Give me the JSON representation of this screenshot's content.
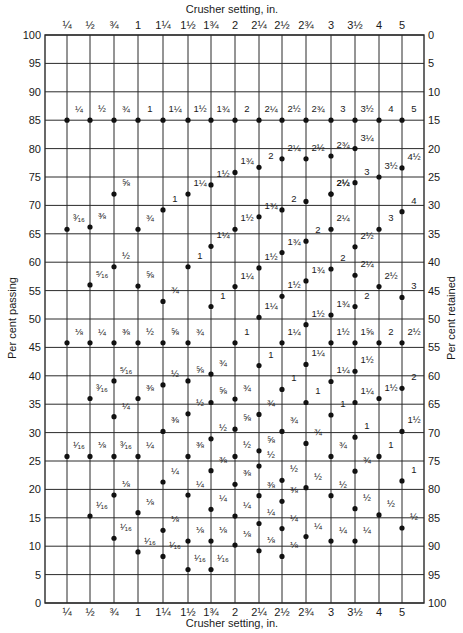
{
  "chart_data": {
    "type": "scatter",
    "title": "",
    "xlabel": "Crusher setting, in.",
    "ylabel": "Per cent passing",
    "ylabel_right": "Per cent retained",
    "ylim": [
      0,
      100
    ],
    "y_ticks_left": [
      100,
      95,
      90,
      85,
      80,
      75,
      70,
      65,
      60,
      55,
      50,
      45,
      40,
      35,
      30,
      25,
      20,
      15,
      10,
      5,
      0
    ],
    "y_ticks_right": [
      0,
      5,
      10,
      15,
      20,
      25,
      30,
      35,
      40,
      45,
      50,
      55,
      60,
      65,
      70,
      75,
      80,
      85,
      90,
      95,
      100
    ],
    "grid": true,
    "categories": [
      "1/4",
      "1/2",
      "3/4",
      "1",
      "1 1/4",
      "1 1/2",
      "1 3/4",
      "2",
      "2 1/4",
      "2 1/2",
      "2 3/4",
      "3",
      "3 1/2",
      "4",
      "5"
    ],
    "category_labels_top": [
      "¼",
      "½",
      "¾",
      "1",
      "1¼",
      "1½",
      "1¾",
      "2",
      "2¼",
      "2½",
      "2¾",
      "3",
      "3½",
      "4",
      "5"
    ],
    "category_labels_bottom": [
      "¼",
      "½",
      "¾",
      "1",
      "1¼",
      "1½",
      "1¾",
      "2",
      "2¼",
      "2½",
      "2¾",
      "3",
      "3½",
      "4",
      "5"
    ],
    "series_note": "Each point: [column index, per cent passing, screen size label]",
    "points": [
      [
        0,
        85,
        "¼"
      ],
      [
        1,
        85,
        "½"
      ],
      [
        2,
        85,
        "¾"
      ],
      [
        3,
        85,
        "1"
      ],
      [
        4,
        85,
        "1¼"
      ],
      [
        5,
        85,
        "1½"
      ],
      [
        6,
        85,
        "1¾"
      ],
      [
        7,
        85,
        "2"
      ],
      [
        8,
        85,
        "2¼"
      ],
      [
        9,
        85,
        "2½"
      ],
      [
        10,
        85,
        "2¾"
      ],
      [
        11,
        85,
        "3"
      ],
      [
        12,
        85,
        "3½"
      ],
      [
        13,
        85,
        "4"
      ],
      [
        14,
        85,
        "5"
      ],
      [
        12,
        80,
        "3¼"
      ],
      [
        7,
        75.8,
        "1¾"
      ],
      [
        8,
        76.7,
        "2"
      ],
      [
        9,
        78.2,
        "2¼"
      ],
      [
        10,
        78.2,
        "2½"
      ],
      [
        11,
        78.7,
        "2¾"
      ],
      [
        13,
        75,
        "3½"
      ],
      [
        14,
        76.6,
        "4½"
      ],
      [
        2,
        72,
        "⅝"
      ],
      [
        5,
        72,
        "1¼"
      ],
      [
        6,
        73.6,
        "1½"
      ],
      [
        10,
        70.7,
        ""
      ],
      [
        11,
        72,
        "2¼"
      ],
      [
        11,
        72,
        "2½"
      ],
      [
        12,
        74,
        "3"
      ],
      [
        0,
        65.8,
        "³⁄₁₆"
      ],
      [
        1,
        66.2,
        "⅜"
      ],
      [
        3,
        65.8,
        "¾"
      ],
      [
        4,
        69.2,
        "1"
      ],
      [
        7,
        65.8,
        "1½"
      ],
      [
        8,
        68,
        "1¾"
      ],
      [
        9,
        69.2,
        "2"
      ],
      [
        11,
        65.8,
        "2¼"
      ],
      [
        13,
        65.8,
        "3"
      ],
      [
        14,
        68.9,
        "4"
      ],
      [
        6,
        62.8,
        "1¼"
      ],
      [
        9,
        61.7,
        "1¾"
      ],
      [
        10,
        63.7,
        "2"
      ],
      [
        12,
        62.7,
        "2½"
      ],
      [
        1,
        56,
        "⁵⁄₁₆"
      ],
      [
        2,
        59.2,
        "½"
      ],
      [
        3,
        55.8,
        "⅝"
      ],
      [
        5,
        59.2,
        "1"
      ],
      [
        7,
        55.7,
        "1¼"
      ],
      [
        8,
        59,
        "1½"
      ],
      [
        10,
        56.7,
        "1¾"
      ],
      [
        11,
        58.8,
        "2"
      ],
      [
        12,
        57.7,
        "2¼"
      ],
      [
        13,
        55.7,
        "2½"
      ],
      [
        4,
        53.1,
        "¾"
      ],
      [
        6,
        52.2,
        "1"
      ],
      [
        8,
        50.3,
        "1¼"
      ],
      [
        9,
        54,
        "1½"
      ],
      [
        11,
        50.7,
        "1¾"
      ],
      [
        12,
        52.2,
        "2"
      ],
      [
        14,
        53.8,
        "3"
      ],
      [
        0,
        45.8,
        "⅛"
      ],
      [
        1,
        45.8,
        "¼"
      ],
      [
        2,
        45.8,
        "⅜"
      ],
      [
        3,
        45.8,
        "½"
      ],
      [
        4,
        45.8,
        "⅝"
      ],
      [
        5,
        45.8,
        "¾"
      ],
      [
        7,
        45.8,
        "1"
      ],
      [
        9,
        45.8,
        "1¼"
      ],
      [
        10,
        49,
        "1½"
      ],
      [
        11,
        45.8,
        "1½"
      ],
      [
        12,
        45.8,
        "1⅝"
      ],
      [
        13,
        45.8,
        "2"
      ],
      [
        14,
        45.8,
        "2½"
      ],
      [
        6,
        40.3,
        "¾"
      ],
      [
        8,
        41.8,
        "1"
      ],
      [
        10,
        42,
        "1¼"
      ],
      [
        12,
        40.8,
        "1½"
      ],
      [
        1,
        36,
        "³⁄₁₆"
      ],
      [
        2,
        39.1,
        "⁵⁄₁₆"
      ],
      [
        3,
        36,
        "⅜"
      ],
      [
        4,
        38.4,
        "½"
      ],
      [
        5,
        39.1,
        "⅝"
      ],
      [
        6,
        35.3,
        "⅝"
      ],
      [
        7,
        35.9,
        "¾"
      ],
      [
        9,
        37.6,
        "1"
      ],
      [
        10,
        35.3,
        "1"
      ],
      [
        11,
        39,
        "1¼"
      ],
      [
        12,
        35.3,
        "1¼"
      ],
      [
        13,
        36,
        "1½"
      ],
      [
        14,
        37.8,
        "2"
      ],
      [
        2,
        32.8,
        "¼"
      ],
      [
        4,
        30.2,
        "⅜"
      ],
      [
        5,
        33.3,
        "½"
      ],
      [
        7,
        30.6,
        "⅝"
      ],
      [
        8,
        33.2,
        "¾"
      ],
      [
        9,
        30.2,
        "¾"
      ],
      [
        11,
        33.1,
        "1"
      ],
      [
        14,
        30.2,
        "1½"
      ],
      [
        0,
        25.8,
        "¹⁄₁₆"
      ],
      [
        1,
        25.8,
        "⅛"
      ],
      [
        2,
        25.8,
        "³⁄₁₆"
      ],
      [
        3,
        25.8,
        "¼"
      ],
      [
        5,
        25.8,
        "⅜"
      ],
      [
        6,
        28.9,
        "½"
      ],
      [
        7,
        25.8,
        "½"
      ],
      [
        8,
        26.8,
        "⅝"
      ],
      [
        10,
        28.1,
        "¾"
      ],
      [
        11,
        25.8,
        "¾"
      ],
      [
        12,
        29.2,
        "1"
      ],
      [
        13,
        25.8,
        "1"
      ],
      [
        4,
        21.3,
        "¼"
      ],
      [
        6,
        23.3,
        "⅜"
      ],
      [
        7,
        20.9,
        "⅜"
      ],
      [
        8,
        24.1,
        "½"
      ],
      [
        9,
        21.6,
        "½"
      ],
      [
        10,
        20.3,
        "½"
      ],
      [
        12,
        23.2,
        "¾"
      ],
      [
        14,
        21.5,
        "1"
      ],
      [
        1,
        15.3,
        "¹⁄₁₆"
      ],
      [
        2,
        19,
        "⅛"
      ],
      [
        3,
        15.9,
        "⅛"
      ],
      [
        5,
        19,
        "¼"
      ],
      [
        6,
        16.5,
        "¼"
      ],
      [
        7,
        15.3,
        "¼"
      ],
      [
        8,
        18.9,
        "⅜"
      ],
      [
        9,
        17.9,
        "⅜"
      ],
      [
        11,
        18.9,
        "½"
      ],
      [
        12,
        16.6,
        "½"
      ],
      [
        13,
        15.5,
        "½"
      ],
      [
        2,
        11.4,
        "¹⁄₁₆"
      ],
      [
        4,
        12.8,
        "⅛"
      ],
      [
        5,
        10.9,
        "⅛"
      ],
      [
        6,
        10.9,
        "⅛"
      ],
      [
        7,
        10.2,
        "⅛"
      ],
      [
        8,
        14,
        "¼"
      ],
      [
        9,
        13.1,
        "¼"
      ],
      [
        10,
        11.7,
        "¼"
      ],
      [
        11,
        10.9,
        "¼"
      ],
      [
        12,
        10.9,
        "¼"
      ],
      [
        14,
        13.2,
        "½"
      ],
      [
        3,
        9,
        "¹⁄₁₆"
      ],
      [
        4,
        8.2,
        "¹⁄₁₆"
      ],
      [
        5,
        5.9,
        "¹⁄₁₆"
      ],
      [
        6,
        5.9,
        "¹⁄₁₆"
      ],
      [
        8,
        9.2,
        "⅛"
      ],
      [
        9,
        8.2,
        "⅛"
      ]
    ]
  },
  "layout": {
    "plot_left": 45,
    "plot_right": 424,
    "plot_top": 35,
    "plot_bottom": 603,
    "column_x": [
      67,
      90,
      114,
      138,
      163,
      188,
      211,
      235,
      259,
      282,
      306,
      331,
      355,
      379,
      402
    ]
  }
}
